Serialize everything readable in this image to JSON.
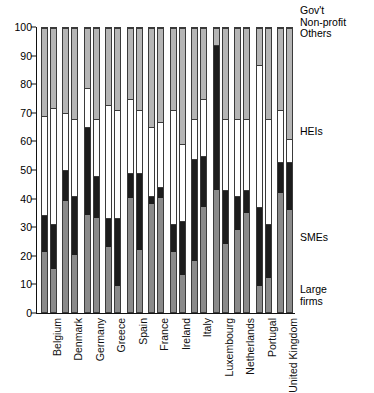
{
  "chart_data": {
    "type": "bar",
    "title": "",
    "subtitle": "",
    "xlabel": "",
    "ylabel": "",
    "ylim": [
      0,
      100
    ],
    "yticks": [
      0,
      10,
      20,
      30,
      40,
      50,
      60,
      70,
      80,
      90,
      100
    ],
    "grid": false,
    "stacked": true,
    "stack_order_bottom_to_top": [
      "Large firms",
      "SMEs",
      "HEIs",
      "Gov't Non-profit Others"
    ],
    "bars_per_category": 2,
    "legend_position": "right",
    "legend_entries": [
      {
        "key": "gov",
        "label": "Gov't\nNon-profit\nOthers",
        "color": "#b5b5b5"
      },
      {
        "key": "hei",
        "label": "HEIs",
        "color": "#ffffff"
      },
      {
        "key": "sme",
        "label": "SMEs",
        "color": "#1c1c1c"
      },
      {
        "key": "large",
        "label": "Large\nfirms",
        "color": "#8a8a8a"
      }
    ],
    "categories": [
      "Belgium",
      "Denmark",
      "Germany",
      "Greece",
      "Spain",
      "France",
      "Ireland",
      "Italy",
      "Luxembourg",
      "Netherlands",
      "Portugal",
      "United Kingdom"
    ],
    "series": [
      {
        "name": "Large firms",
        "color": "#8a8a8a",
        "values_bar1": [
          21,
          39,
          34,
          23,
          40,
          38,
          21,
          18,
          43,
          29,
          9,
          42
        ],
        "values_bar2": [
          15,
          20,
          33,
          9,
          22,
          40,
          13,
          37,
          24,
          35,
          12,
          36
        ]
      },
      {
        "name": "SMEs",
        "color": "#1c1c1c",
        "values_bar1": [
          13,
          11,
          31,
          10,
          9,
          3,
          10,
          36,
          51,
          12,
          28,
          11
        ],
        "values_bar2": [
          16,
          21,
          15,
          24,
          27,
          4,
          19,
          18,
          19,
          8,
          19,
          17
        ]
      },
      {
        "name": "HEIs",
        "color": "#ffffff",
        "values_bar1": [
          35,
          20,
          14,
          40,
          26,
          24,
          40,
          14,
          0,
          27,
          50,
          18
        ],
        "values_bar2": [
          41,
          27,
          20,
          38,
          22,
          23,
          27,
          20,
          25,
          25,
          37,
          8
        ]
      },
      {
        "name": "Gov't Non-profit Others",
        "color": "#b5b5b5",
        "values_bar1": [
          31,
          30,
          21,
          27,
          25,
          35,
          29,
          32,
          6,
          32,
          13,
          29
        ],
        "values_bar2": [
          28,
          32,
          32,
          29,
          29,
          33,
          41,
          25,
          32,
          32,
          32,
          39
        ]
      }
    ]
  },
  "legend": {
    "gov": "Gov't\nNon-profit\nOthers",
    "hei": "HEIs",
    "sme": "SMEs",
    "large": "Large\nfirms"
  }
}
